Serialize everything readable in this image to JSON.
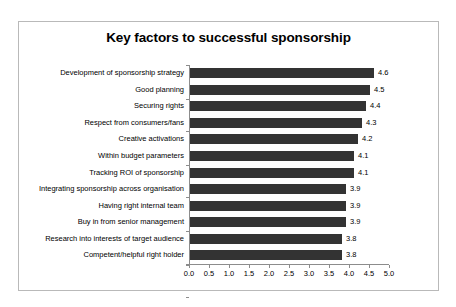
{
  "chart_data": {
    "type": "bar",
    "orientation": "horizontal",
    "title": "Key factors to successful sponsorship",
    "xlabel": "",
    "ylabel": "",
    "xlim": [
      0.0,
      5.0
    ],
    "xticks": [
      "0.0",
      "0.5",
      "1.0",
      "1.5",
      "2.0",
      "2.5",
      "3.0",
      "3.5",
      "4.0",
      "4.5",
      "5.0"
    ],
    "grid": false,
    "legend": false,
    "bar_color": "#333333",
    "categories": [
      "Development of sponsorship strategy",
      "Good planning",
      "Securing rights",
      "Respect from consumers/fans",
      "Creative activations",
      "Within budget parameters",
      "Tracking ROI of sponsorship",
      "Integrating sponsorship across organisation",
      "Having right internal team",
      "Buy in from senior management",
      "Research into interests of target audience",
      "Competent/helpful right holder"
    ],
    "values": [
      4.6,
      4.5,
      4.4,
      4.3,
      4.2,
      4.1,
      4.1,
      3.9,
      3.9,
      3.9,
      3.8,
      3.8
    ],
    "value_labels": [
      "4.6",
      "4.5",
      "4.4",
      "4.3",
      "4.2",
      "4.1",
      "4.1",
      "3.9",
      "3.9",
      "3.9",
      "3.8",
      "3.8"
    ]
  }
}
